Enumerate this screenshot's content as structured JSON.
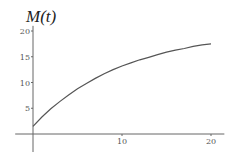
{
  "chart_data": {
    "type": "line",
    "title": "M(t)",
    "xlabel": "",
    "ylabel": "M(t)",
    "xlim": [
      -2,
      21.5
    ],
    "ylim": [
      -3.5,
      21
    ],
    "grid": false,
    "legend": null,
    "x_ticks": [
      10,
      20
    ],
    "x_tick_labels": [
      "10",
      "20"
    ],
    "y_ticks": [
      5,
      10,
      15,
      20
    ],
    "y_tick_labels": [
      "5",
      "10",
      "15",
      "20"
    ],
    "series": [
      {
        "name": "M(t)",
        "color": "#555555",
        "x": [
          0,
          1,
          2,
          3,
          4,
          5,
          6,
          7,
          8,
          9,
          10,
          11,
          12,
          13,
          14,
          15,
          16,
          17,
          18,
          19,
          20
        ],
        "y": [
          1.5,
          3.3,
          4.9,
          6.3,
          7.6,
          8.8,
          9.8,
          10.8,
          11.7,
          12.5,
          13.2,
          13.8,
          14.4,
          14.9,
          15.4,
          15.9,
          16.3,
          16.6,
          17.0,
          17.3,
          17.5
        ]
      }
    ]
  },
  "colors": {
    "axis": "#666666",
    "curve": "#555555",
    "background": "#ffffff"
  }
}
